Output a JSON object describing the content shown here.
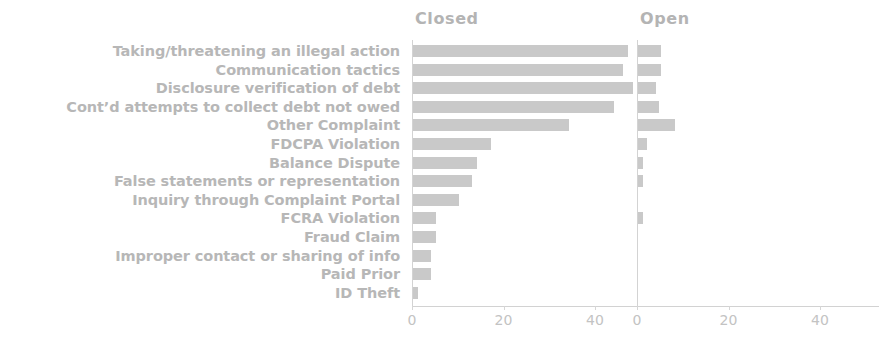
{
  "chart_data": {
    "type": "bar",
    "orientation": "horizontal",
    "title": "",
    "subtitle": "",
    "xlabel": "",
    "ylabel": "",
    "grid": false,
    "legend_position": "none",
    "panel_layout": "side-by-side faceted",
    "xlim": [
      0,
      50
    ],
    "xticks": [
      0,
      20,
      40
    ],
    "xtick_labels": [
      "0",
      "20",
      "40"
    ],
    "categories": [
      "Taking/threatening an illegal action",
      "Communication tactics",
      "Disclosure verification of debt",
      "Cont’d attempts to collect debt not owed",
      "Other Complaint",
      "FDCPA Violation",
      "Balance Dispute",
      "False statements or representation",
      "Inquiry through Complaint Portal",
      "FCRA Violation",
      "Fraud Claim",
      "Improper contact or sharing of info",
      "Paid Prior",
      "ID Theft"
    ],
    "series": [
      {
        "name": "Closed",
        "values": [
          47,
          46,
          48,
          44,
          34,
          17,
          14,
          13,
          10,
          5,
          5,
          4,
          4,
          1
        ]
      },
      {
        "name": "Open",
        "values": [
          5,
          5,
          4,
          4.5,
          8,
          2,
          1,
          1,
          0,
          1,
          0,
          0,
          0,
          0
        ]
      }
    ]
  },
  "panels": [
    {
      "title": "Closed"
    },
    {
      "title": "Open"
    }
  ],
  "colors": {
    "bar": "#c9c9c9",
    "label_text": "#b7b7b7",
    "title_text": "#b4b4b4",
    "tick_text": "#c3c3c3",
    "axis_line": "#d3d3d3",
    "background": "#ffffff"
  }
}
